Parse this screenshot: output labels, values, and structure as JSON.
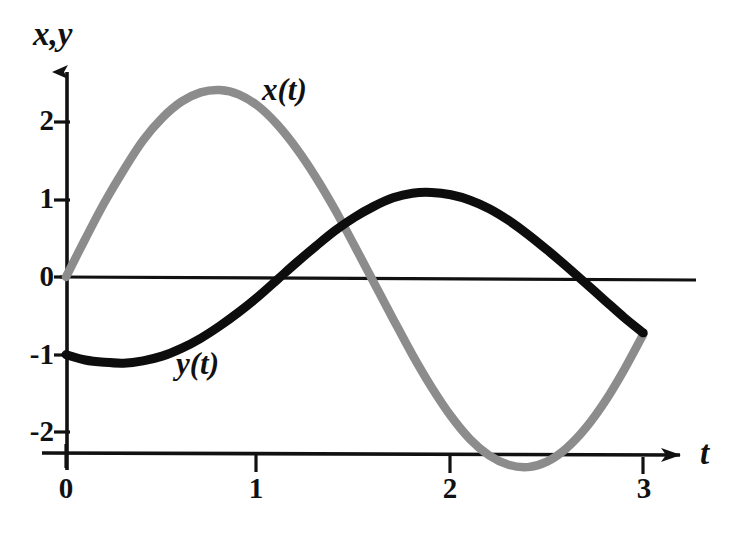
{
  "figure": {
    "background_color": "#ffffff",
    "width": 731,
    "height": 536
  },
  "axes": {
    "y_axis_title": "x,y",
    "x_axis_title": "t",
    "y_ticks": [
      "2",
      "1",
      "0",
      "-1",
      "-2"
    ],
    "x_ticks": [
      "0",
      "1",
      "2",
      "3"
    ]
  },
  "legend": {
    "x_series_label": "x(t)",
    "y_series_label": "y(t)"
  },
  "colors": {
    "x_curve": "#8c8c8c",
    "y_curve": "#0d0d0d",
    "axis": "#111111",
    "zero_line": "#111111",
    "text": "#111111"
  },
  "chart_data": {
    "type": "line",
    "title": "",
    "xlabel": "t",
    "ylabel": "x,y",
    "xlim": [
      0,
      3.3
    ],
    "ylim": [
      -2.5,
      2.8
    ],
    "grid": false,
    "legend_position": "inline-annotation",
    "x_tick_values": [
      0,
      1,
      2,
      3
    ],
    "y_tick_values": [
      2,
      1,
      0,
      -1,
      -2
    ],
    "annotations": [
      {
        "text": "x(t)",
        "t": 1.05,
        "value": 2.35
      },
      {
        "text": "y(t)",
        "t": 0.62,
        "value": -1.3
      }
    ],
    "x": [
      0,
      0.1,
      0.2,
      0.3,
      0.4,
      0.5,
      0.6,
      0.7,
      0.8,
      0.9,
      1.0,
      1.1,
      1.2,
      1.3,
      1.4,
      1.5,
      1.6,
      1.7,
      1.8,
      1.9,
      2.0,
      2.1,
      2.2,
      2.3,
      2.4,
      2.5,
      2.6,
      2.7,
      2.8,
      2.9,
      3.0
    ],
    "series": [
      {
        "name": "x(t)",
        "color": "#8c8c8c",
        "values": [
          0.0,
          0.49,
          0.96,
          1.38,
          1.76,
          2.05,
          2.26,
          2.38,
          2.41,
          2.35,
          2.2,
          1.96,
          1.65,
          1.28,
          0.86,
          0.4,
          -0.07,
          -0.54,
          -1.0,
          -1.42,
          -1.79,
          -2.09,
          -2.3,
          -2.42,
          -2.45,
          -2.38,
          -2.21,
          -1.95,
          -1.61,
          -1.2,
          -0.74
        ]
      },
      {
        "name": "y(t)",
        "color": "#0d0d0d",
        "values": [
          -1.0,
          -1.07,
          -1.1,
          -1.11,
          -1.08,
          -1.02,
          -0.92,
          -0.79,
          -0.63,
          -0.45,
          -0.25,
          -0.03,
          0.19,
          0.4,
          0.6,
          0.77,
          0.91,
          1.02,
          1.08,
          1.09,
          1.06,
          0.99,
          0.88,
          0.73,
          0.55,
          0.35,
          0.14,
          -0.08,
          -0.3,
          -0.52,
          -0.72
        ]
      }
    ]
  }
}
